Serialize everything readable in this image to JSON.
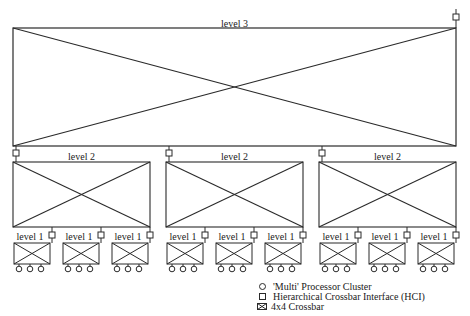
{
  "diagram": {
    "level3": {
      "label": "level 3",
      "x": 13,
      "y": 28,
      "w": 443,
      "h": 118,
      "hci": {
        "x": 453,
        "y": 17
      }
    },
    "level2_label": "level 2",
    "level1_label": "level 1",
    "level2_boxes": [
      {
        "x": 13,
        "y": 162,
        "w": 137,
        "h": 65,
        "hci_x": 16
      },
      {
        "x": 166,
        "y": 162,
        "w": 137,
        "h": 65,
        "hci_x": 169
      },
      {
        "x": 319,
        "y": 162,
        "w": 137,
        "h": 65,
        "hci_x": 322
      }
    ],
    "level1_boxes_per_group": 3,
    "processors_per_cluster": 3
  },
  "legend": {
    "items": [
      {
        "icon": "circle-icon",
        "label": "'Multi' Processor Cluster"
      },
      {
        "icon": "square-icon",
        "label": "Hierarchical Crossbar Interface (HCI)"
      },
      {
        "icon": "crossbar-icon",
        "label": "4x4 Crossbar"
      }
    ]
  },
  "colors": {
    "line": "#2a2a2a",
    "background": "#ffffff"
  }
}
